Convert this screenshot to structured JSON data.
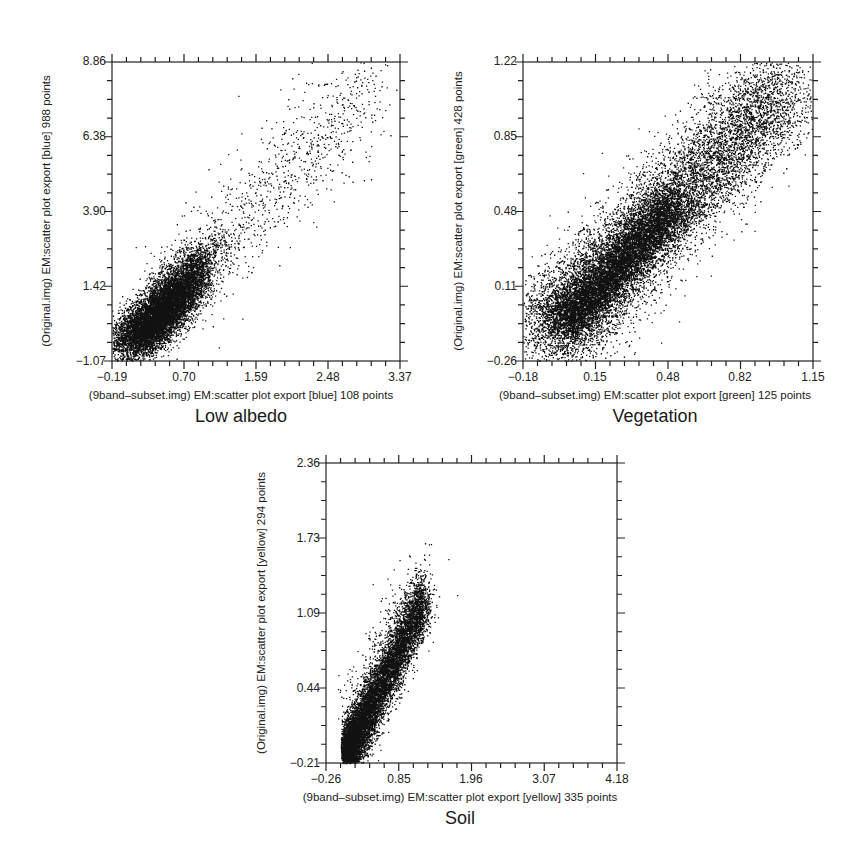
{
  "chart_data": [
    {
      "type": "scatter",
      "title": "Low albedo",
      "xlabel": "(9band–subset.img) EM:scatter plot export [blue] 108 points",
      "ylabel": "(Original.img) EM:scatter plot export [blue] 988 points",
      "xticks": [
        "−0.19",
        "0.70",
        "1.59",
        "2.48",
        "3.37"
      ],
      "yticks": [
        "−1.07",
        "1.42",
        "3.90",
        "6.38",
        "8.86"
      ],
      "xlim": [
        -0.19,
        3.37
      ],
      "ylim": [
        -1.07,
        8.86
      ],
      "grid": false,
      "point_color": "#111111",
      "distribution": {
        "core_x": 0.55,
        "core_y": 0.9,
        "description": "dense cluster near (0.0-1.1, -0.8-2.5), sparse tail extending to (3.2, 8.5)"
      }
    },
    {
      "type": "scatter",
      "title": "Vegetation",
      "xlabel": "(9band–subset.img) EM:scatter plot export [green] 125 points",
      "ylabel": "(Original.img) EM:scatter plot export [green] 428 points",
      "xticks": [
        "−0.18",
        "0.15",
        "0.48",
        "0.82",
        "1.15"
      ],
      "yticks": [
        "−0.26",
        "0.11",
        "0.48",
        "0.85",
        "1.22"
      ],
      "xlim": [
        -0.18,
        1.15
      ],
      "ylim": [
        -0.26,
        1.22
      ],
      "grid": false,
      "point_color": "#111111",
      "distribution": {
        "core_x": 0.3,
        "core_y": 0.3,
        "description": "broad elongated cloud along diagonal from (-0.15,-0.2) to (1.1,1.2)"
      }
    },
    {
      "type": "scatter",
      "title": "Soil",
      "xlabel": "(9band–subset.img) EM:scatter plot export [yellow] 335 points",
      "ylabel": "(Original.img) EM:scatter plot export [yellow] 294 points",
      "xticks": [
        "−0.26",
        "0.85",
        "1.96",
        "3.07",
        "4.18"
      ],
      "yticks": [
        "−0.21",
        "0.44",
        "1.09",
        "1.73",
        "2.36"
      ],
      "xlim": [
        -0.26,
        4.18
      ],
      "ylim": [
        -0.21,
        2.36
      ],
      "grid": false,
      "point_color": "#111111",
      "distribution": {
        "core_x": 0.35,
        "core_y": 0.35,
        "description": "narrow steep cluster from (0.0,-0.15) to (1.4,1.5), outliers up to (1.5,1.8)"
      }
    }
  ]
}
